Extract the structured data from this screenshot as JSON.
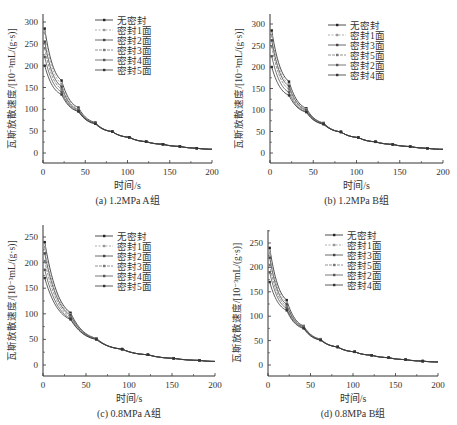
{
  "figure": {
    "panels": [
      {
        "id": "a",
        "caption": "(a)  1.2MPa  A组"
      },
      {
        "id": "b",
        "caption": "(b)  1.2MPa  B组"
      },
      {
        "id": "c",
        "caption": "(c)  0.8MPa  A组"
      },
      {
        "id": "d",
        "caption": "(d)  0.8MPa  B组"
      }
    ]
  },
  "chart_data": [
    {
      "type": "line",
      "title": "(a) 1.2MPa A组",
      "xlabel": "时间/s",
      "ylabel": "瓦斯放散速度/[10⁻³mL/(g·s)]",
      "xlim": [
        0,
        200
      ],
      "ylim": [
        -25,
        325
      ],
      "xticks": [
        0,
        50,
        100,
        150,
        200
      ],
      "yticks": [
        0,
        50,
        100,
        150,
        200,
        250,
        300
      ],
      "grid": false,
      "legend_position": "upper right",
      "x": [
        2,
        22,
        42,
        62,
        82,
        102,
        122,
        142,
        162,
        182
      ],
      "series": [
        {
          "name": "无密封",
          "values": [
            285,
            166,
            104,
            70,
            49,
            36,
            26,
            20,
            15,
            11
          ]
        },
        {
          "name": "密封1面",
          "values": [
            275,
            158,
            101,
            69,
            49,
            36,
            26,
            20,
            15,
            11
          ]
        },
        {
          "name": "密封2面",
          "values": [
            255,
            152,
            99,
            68,
            49,
            36,
            26,
            20,
            15,
            11
          ]
        },
        {
          "name": "密封3面",
          "values": [
            240,
            146,
            97,
            68,
            49,
            36,
            26,
            20,
            15,
            11
          ]
        },
        {
          "name": "密封4面",
          "values": [
            220,
            140,
            96,
            67,
            49,
            36,
            26,
            20,
            15,
            11
          ]
        },
        {
          "name": "密封5面",
          "values": [
            200,
            134,
            95,
            67,
            49,
            36,
            26,
            20,
            15,
            11
          ]
        }
      ]
    },
    {
      "type": "line",
      "title": "(b) 1.2MPa B组",
      "xlabel": "时间/s",
      "ylabel": "瓦斯放散速度/[10⁻³mL/(g·s)]",
      "xlim": [
        0,
        200
      ],
      "ylim": [
        -25,
        325
      ],
      "xticks": [
        0,
        50,
        100,
        150,
        200
      ],
      "yticks": [
        0,
        50,
        100,
        150,
        200,
        250,
        300
      ],
      "grid": false,
      "legend_position": "upper right",
      "x": [
        2,
        22,
        42,
        62,
        82,
        102,
        122,
        142,
        162,
        182
      ],
      "series": [
        {
          "name": "无密封",
          "values": [
            285,
            166,
            104,
            70,
            49,
            36,
            26,
            20,
            15,
            11
          ]
        },
        {
          "name": "密封1面",
          "values": [
            272,
            160,
            102,
            69,
            49,
            36,
            26,
            20,
            15,
            11
          ]
        },
        {
          "name": "密封3面",
          "values": [
            262,
            155,
            100,
            69,
            49,
            36,
            26,
            20,
            15,
            11
          ]
        },
        {
          "name": "密封5面",
          "values": [
            248,
            148,
            98,
            68,
            49,
            36,
            26,
            20,
            15,
            11
          ]
        },
        {
          "name": "密封2面",
          "values": [
            225,
            141,
            96,
            67,
            49,
            36,
            26,
            20,
            15,
            11
          ]
        },
        {
          "name": "密封4面",
          "values": [
            200,
            134,
            95,
            67,
            49,
            36,
            26,
            20,
            15,
            11
          ]
        }
      ]
    },
    {
      "type": "line",
      "title": "(c) 0.8MPa A组",
      "xlabel": "时间/s",
      "ylabel": "瓦斯放散速度/[10⁻³mL/(g·s)]",
      "xlim": [
        0,
        200
      ],
      "ylim": [
        -25,
        275
      ],
      "xticks": [
        0,
        50,
        100,
        150,
        200
      ],
      "yticks": [
        0,
        50,
        100,
        150,
        200,
        250
      ],
      "grid": false,
      "legend_position": "upper right",
      "x": [
        2,
        32,
        62,
        92,
        122,
        152,
        182
      ],
      "series": [
        {
          "name": "无密封",
          "values": [
            240,
            102,
            52,
            31,
            20,
            13,
            9
          ]
        },
        {
          "name": "密封1面",
          "values": [
            230,
            99,
            52,
            31,
            20,
            13,
            9
          ]
        },
        {
          "name": "密封2面",
          "values": [
            218,
            97,
            51,
            31,
            20,
            13,
            9
          ]
        },
        {
          "name": "密封3面",
          "values": [
            203,
            94,
            51,
            31,
            20,
            13,
            9
          ]
        },
        {
          "name": "密封4面",
          "values": [
            186,
            91,
            50,
            31,
            20,
            13,
            9
          ]
        },
        {
          "name": "密封5面",
          "values": [
            170,
            89,
            50,
            31,
            20,
            13,
            9
          ]
        }
      ]
    },
    {
      "type": "line",
      "title": "(d) 0.8MPa B组",
      "xlabel": "时间/s",
      "ylabel": "瓦斯放散速度/[10⁻³mL/(g·s)]",
      "xlim": [
        0,
        200
      ],
      "ylim": [
        -25,
        275
      ],
      "xticks": [
        0,
        50,
        100,
        150,
        200
      ],
      "yticks": [
        0,
        50,
        100,
        150,
        200,
        250
      ],
      "grid": false,
      "legend_position": "upper right",
      "x": [
        2,
        22,
        42,
        62,
        82,
        102,
        122,
        142,
        162,
        182
      ],
      "series": [
        {
          "name": "无密封",
          "values": [
            240,
            133,
            80,
            53,
            37,
            27,
            20,
            15,
            11,
            8
          ]
        },
        {
          "name": "密封1面",
          "values": [
            230,
            128,
            79,
            53,
            37,
            27,
            20,
            15,
            11,
            8
          ]
        },
        {
          "name": "密封3面",
          "values": [
            220,
            124,
            78,
            52,
            37,
            27,
            20,
            15,
            11,
            8
          ]
        },
        {
          "name": "密封5面",
          "values": [
            205,
            120,
            77,
            52,
            37,
            27,
            20,
            15,
            11,
            8
          ]
        },
        {
          "name": "密封2面",
          "values": [
            190,
            116,
            76,
            51,
            37,
            27,
            20,
            15,
            11,
            8
          ]
        },
        {
          "name": "密封4面",
          "values": [
            170,
            112,
            75,
            51,
            37,
            27,
            20,
            15,
            11,
            8
          ]
        }
      ]
    }
  ]
}
